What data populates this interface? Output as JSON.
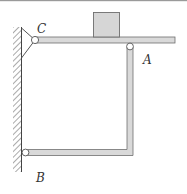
{
  "diagram": {
    "type": "mechanics-structure",
    "labels": {
      "C": "C",
      "A": "A",
      "B": "B"
    },
    "colors": {
      "bar_fill": "#d9d9d9",
      "bar_stroke": "#6e6e6e",
      "block_fill": "#d6d6d6",
      "wall_hatch": "#555555",
      "pin_fill": "#ffffff",
      "text": "#333333",
      "top_rule": "#9a9a9a"
    },
    "components": [
      {
        "name": "wall",
        "description": "fixed hatched wall on left"
      },
      {
        "name": "beam-CA",
        "description": "horizontal beam pinned at C, resting on pin A"
      },
      {
        "name": "block",
        "description": "square load block on beam"
      },
      {
        "name": "bent-bar-AB",
        "description": "L-shaped bar from A down and left to B"
      },
      {
        "name": "support-C",
        "description": "triangular bracket with pin at C"
      },
      {
        "name": "pin-A",
        "description": "pin joint A"
      },
      {
        "name": "pin-B",
        "description": "pin joint B on wall"
      }
    ]
  }
}
